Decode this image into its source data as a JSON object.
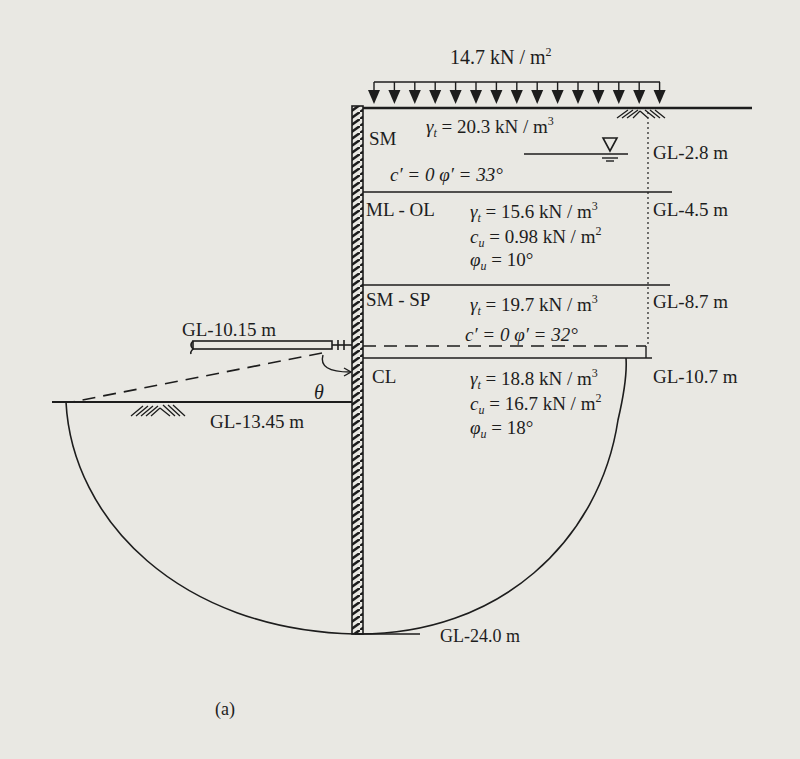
{
  "figure": {
    "caption": "(a)",
    "surcharge": {
      "value": "14.7",
      "unit": "kN / m",
      "exp": "2"
    },
    "theta_label": "θ",
    "strut": {
      "label": "GL-10.15 m"
    },
    "excavation_level": {
      "label": "GL-13.45 m"
    },
    "wall_toe": {
      "label": "GL-24.0 m"
    },
    "water_table": {
      "label": "GL-2.8 m"
    },
    "layers": [
      {
        "name": "SM",
        "bottom_label": "",
        "props": [
          {
            "sym": "γ",
            "sub": "t",
            "eq": " = 20.3 kN / m",
            "exp": "3"
          },
          {
            "text": "c′ = 0   φ′ = 33°"
          }
        ]
      },
      {
        "name": "ML - OL",
        "top_label": "GL-4.5 m",
        "props": [
          {
            "sym": "γ",
            "sub": "t",
            "eq": " = 15.6 kN / m",
            "exp": "3"
          },
          {
            "sym": "c",
            "sub": "u",
            "eq": " = 0.98 kN / m",
            "exp": "2"
          },
          {
            "sym": "φ",
            "sub": "u",
            "eq": " = 10°",
            "exp": ""
          }
        ]
      },
      {
        "name": "SM - SP",
        "top_label": "GL-8.7 m",
        "props": [
          {
            "sym": "γ",
            "sub": "t",
            "eq": " = 19.7 kN / m",
            "exp": "3"
          },
          {
            "text": "c′ = 0  φ′ = 32°"
          }
        ]
      },
      {
        "name": "CL",
        "top_label": "GL-10.7 m",
        "props": [
          {
            "sym": "γ",
            "sub": "t",
            "eq": " = 18.8 kN / m",
            "exp": "3"
          },
          {
            "sym": "c",
            "sub": "u",
            "eq": " = 16.7 kN / m",
            "exp": "2"
          },
          {
            "sym": "φ",
            "sub": "u",
            "eq": " = 18°",
            "exp": ""
          }
        ]
      }
    ],
    "colors": {
      "ink": "#1d1d1d",
      "paper": "#e9e8e3"
    }
  }
}
